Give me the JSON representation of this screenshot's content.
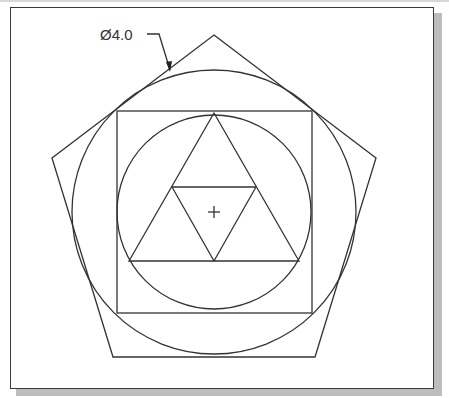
{
  "drawing": {
    "dimension_label": "Ø4.0",
    "center_mark": "+",
    "colors": {
      "line": "#333333",
      "frame": "#3a3a3a",
      "shadow": "#bdbdbd",
      "background": "#ffffff"
    },
    "shapes": {
      "pentagon": [
        [
          214,
          35
        ],
        [
          376,
          158
        ],
        [
          315,
          357
        ],
        [
          113,
          357
        ],
        [
          52,
          158
        ]
      ],
      "outer_circle": {
        "cx": 214,
        "cy": 212,
        "r": 142
      },
      "square": {
        "x": 117,
        "y": 111,
        "w": 195,
        "h": 202
      },
      "inner_circle": {
        "cx": 214,
        "cy": 212,
        "r": 97
      },
      "outer_triangle": [
        [
          214,
          113
        ],
        [
          299,
          261
        ],
        [
          129,
          261
        ]
      ],
      "inner_triangle": [
        [
          172,
          187
        ],
        [
          256,
          187
        ],
        [
          214,
          261
        ]
      ]
    }
  }
}
